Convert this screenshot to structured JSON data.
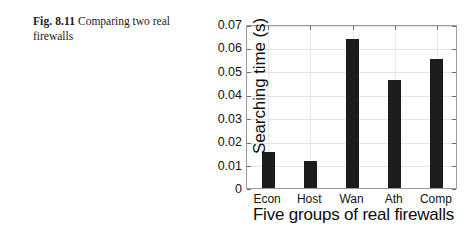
{
  "caption": {
    "label": "Fig. 8.11",
    "text": "Comparing two real firewalls"
  },
  "chart_data": {
    "type": "bar",
    "title": "",
    "categories": [
      "Econ",
      "Host",
      "Wan",
      "Ath",
      "Comp"
    ],
    "values": [
      0.0154,
      0.0115,
      0.0636,
      0.0461,
      0.055
    ],
    "xlabel": "Five groups of real firewalls",
    "ylabel": "Searching time (s)",
    "ylim": [
      0,
      0.07
    ],
    "ytick_labels": [
      "0",
      "0.01",
      "0.02",
      "0.03",
      "0.04",
      "0.05",
      "0.06",
      "0.07"
    ],
    "ytick_values": [
      0,
      0.01,
      0.02,
      0.03,
      0.04,
      0.05,
      0.06,
      0.07
    ],
    "grid": true,
    "legend": null,
    "bar_color": "#1c1c1c",
    "axis_color": "#9a9a9a",
    "grid_color": "#e4e4e4"
  }
}
